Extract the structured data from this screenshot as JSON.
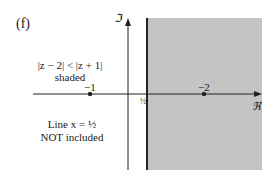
{
  "figure": {
    "panel_label": "(f)",
    "region_label_line1": "|z − 2| < |z + 1|",
    "region_label_line2": "shaded",
    "boundary_label_line1": "Line x = ½",
    "boundary_label_line2": "NOT included",
    "imag_axis_label": "ℑ",
    "real_axis_label": "ℜ",
    "point_minus_one_label": "−1",
    "point_two_label": "−2",
    "half_tick_label": "½",
    "colors": {
      "shade": "#c4c4c4",
      "axis": "#222222",
      "background": "#ffffff"
    }
  }
}
